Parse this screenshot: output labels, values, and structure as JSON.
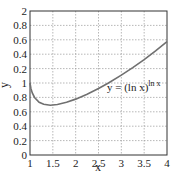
{
  "chart_data": {
    "type": "line",
    "title": "",
    "xlabel": "x",
    "ylabel": "y",
    "xlim": [
      1,
      4
    ],
    "ylim": [
      0,
      2
    ],
    "grid": true,
    "legend": null,
    "x_ticks": [
      1,
      1.5,
      2,
      2.5,
      3,
      3.5,
      4
    ],
    "x_tick_labels": [
      "1",
      "1.5",
      "2",
      "2.5",
      "3",
      "3.5",
      "4"
    ],
    "y_ticks": [
      0,
      0.2,
      0.4,
      0.6,
      0.8,
      1.0,
      1.2,
      1.4,
      1.6,
      1.8,
      2.0
    ],
    "y_tick_labels": [
      "0",
      "0.2",
      "0.4",
      "0.6",
      "0.8",
      "1",
      "0.2",
      "0.4",
      "0.6",
      "0.8",
      "2"
    ],
    "annotation": {
      "text": "y = (ln x)",
      "superscript": "ln x",
      "x": 2.7,
      "y": 0.95
    },
    "series": [
      {
        "name": "y = (ln x)^(ln x)",
        "color": "#707070",
        "x": [
          1.0,
          1.02,
          1.05,
          1.1,
          1.2,
          1.3,
          1.4447,
          1.6,
          1.8,
          2.0,
          2.25,
          2.5,
          2.718,
          3.0,
          3.25,
          3.5,
          3.75,
          4.0
        ],
        "y": [
          1.0,
          0.925,
          0.863,
          0.799,
          0.733,
          0.704,
          0.692,
          0.701,
          0.732,
          0.776,
          0.844,
          0.923,
          1.0,
          1.109,
          1.214,
          1.326,
          1.446,
          1.573
        ]
      }
    ]
  }
}
